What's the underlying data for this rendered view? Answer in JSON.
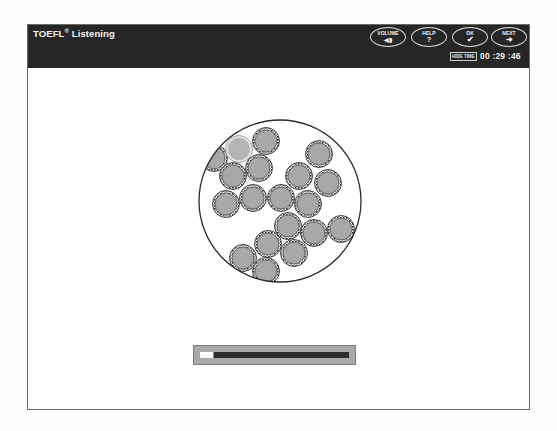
{
  "header": {
    "app_title": "TOEFL",
    "registered_mark": "®",
    "section": "Listening",
    "buttons": [
      {
        "id": "volume",
        "label": "VOLUME",
        "glyph": "◀▮",
        "icon": "speaker-icon"
      },
      {
        "id": "help",
        "label": "HELP",
        "glyph": "?",
        "icon": "question-icon"
      },
      {
        "id": "ok",
        "label": "OK",
        "glyph": "✔",
        "icon": "checkmark-icon"
      },
      {
        "id": "next",
        "label": "NEXT",
        "glyph": "➜",
        "icon": "arrow-right-icon"
      }
    ],
    "hide_time_label": "HIDE TIME",
    "timer": "00 :29 :46"
  },
  "illustration": {
    "description": "Cross-section of a large circle containing many small rounded cells with patterned borders",
    "outer_circle": {
      "cx": 252,
      "cy": 176,
      "r": 81
    },
    "cell_radius": 13.5,
    "cells": [
      {
        "cx": 186,
        "cy": 133,
        "style": "normal"
      },
      {
        "cx": 211,
        "cy": 124,
        "style": "light"
      },
      {
        "cx": 238,
        "cy": 116,
        "style": "normal"
      },
      {
        "cx": 231,
        "cy": 143,
        "style": "normal"
      },
      {
        "cx": 205,
        "cy": 151,
        "style": "normal"
      },
      {
        "cx": 291,
        "cy": 129,
        "style": "normal"
      },
      {
        "cx": 271,
        "cy": 151,
        "style": "normal"
      },
      {
        "cx": 300,
        "cy": 158,
        "style": "normal"
      },
      {
        "cx": 198,
        "cy": 179,
        "style": "normal"
      },
      {
        "cx": 225,
        "cy": 173,
        "style": "normal"
      },
      {
        "cx": 253,
        "cy": 173,
        "style": "normal"
      },
      {
        "cx": 280,
        "cy": 179,
        "style": "normal"
      },
      {
        "cx": 260,
        "cy": 201,
        "style": "normal"
      },
      {
        "cx": 286,
        "cy": 208,
        "style": "normal"
      },
      {
        "cx": 313,
        "cy": 204,
        "style": "normal"
      },
      {
        "cx": 240,
        "cy": 219,
        "style": "normal"
      },
      {
        "cx": 266,
        "cy": 228,
        "style": "normal"
      },
      {
        "cx": 215,
        "cy": 233,
        "style": "normal"
      },
      {
        "cx": 238,
        "cy": 246,
        "style": "normal"
      }
    ],
    "colors": {
      "cell_fill": "#a8a8a8",
      "cell_border": "#3a3a3a",
      "outline": "#2a2a2a"
    }
  },
  "progress": {
    "percent": 9
  }
}
